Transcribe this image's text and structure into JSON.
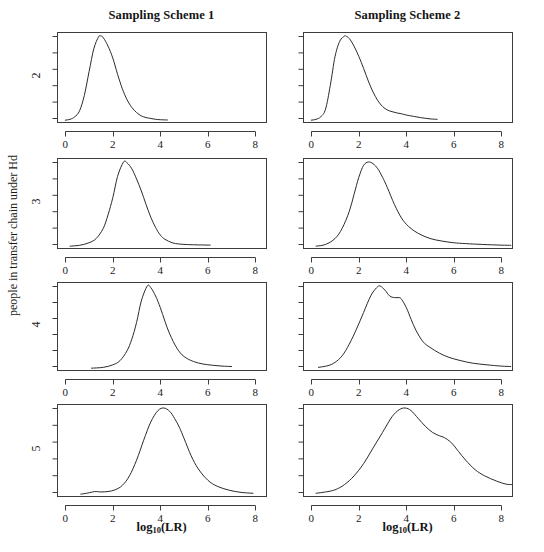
{
  "figure": {
    "width": 544,
    "height": 552,
    "background": "#ffffff",
    "line_color": "#2b2b2b",
    "axis_color": "#3d3d3d",
    "text_color": "#1a1a1a"
  },
  "column_titles": [
    "Sampling Scheme 1",
    "Sampling Scheme 2"
  ],
  "y_axis_label": "people in transfer chain under Hd",
  "x_axis_label_parts": {
    "main": "log",
    "sub": "10",
    "tail": "(LR)"
  },
  "x_axis_label": "log10(LR)",
  "row_labels": [
    "2",
    "3",
    "4",
    "5"
  ],
  "x_tick_labels": [
    "0",
    "2",
    "4",
    "6",
    "8"
  ],
  "chart_data": {
    "type": "line",
    "subtitle": "",
    "xlabel": "log10(LR)",
    "ylabel": "people in transfer chain under Hd",
    "grid": false,
    "legend": "none",
    "xlim": [
      -0.35,
      8.45
    ],
    "x_ticks": [
      0,
      2,
      4,
      6,
      8
    ],
    "y_ticks_labeled": false,
    "y_tick_count": 6,
    "columns": [
      "Sampling Scheme 1",
      "Sampling Scheme 2"
    ],
    "rows": [
      "2",
      "3",
      "4",
      "5"
    ],
    "panels": [
      {
        "row": "2",
        "column": "Sampling Scheme 1",
        "description": "Right-skewed density peaking near log10(LR) = 1.5",
        "mode": 1.5,
        "support": [
          0.0,
          4.3
        ],
        "x": [
          0.0,
          0.2,
          0.4,
          0.6,
          0.8,
          1.0,
          1.2,
          1.4,
          1.5,
          1.6,
          1.8,
          2.0,
          2.2,
          2.4,
          2.6,
          2.8,
          3.0,
          3.2,
          3.4,
          3.6,
          3.8,
          4.0,
          4.3
        ],
        "y": [
          0.01,
          0.02,
          0.05,
          0.12,
          0.3,
          0.58,
          0.85,
          0.99,
          1.0,
          0.98,
          0.88,
          0.74,
          0.55,
          0.38,
          0.25,
          0.16,
          0.1,
          0.06,
          0.04,
          0.03,
          0.02,
          0.015,
          0.012
        ]
      },
      {
        "row": "2",
        "column": "Sampling Scheme 2",
        "description": "Right-skewed density peaking near log10(LR) = 1.45 with long shoulder to 5.2",
        "mode": 1.45,
        "support": [
          0.0,
          5.3
        ],
        "x": [
          0.0,
          0.2,
          0.4,
          0.6,
          0.8,
          1.0,
          1.2,
          1.4,
          1.45,
          1.6,
          1.8,
          2.0,
          2.2,
          2.4,
          2.6,
          2.8,
          3.0,
          3.2,
          3.4,
          3.6,
          3.8,
          4.0,
          4.3,
          4.6,
          5.0,
          5.3
        ],
        "y": [
          0.01,
          0.02,
          0.05,
          0.14,
          0.42,
          0.76,
          0.94,
          1.0,
          1.0,
          0.97,
          0.88,
          0.76,
          0.62,
          0.47,
          0.34,
          0.24,
          0.17,
          0.13,
          0.11,
          0.095,
          0.085,
          0.07,
          0.055,
          0.04,
          0.025,
          0.02
        ]
      },
      {
        "row": "3",
        "column": "Sampling Scheme 1",
        "description": "Density peaking near log10(LR) = 2.45, tail to 6.1",
        "mode": 2.45,
        "support": [
          0.2,
          6.1
        ],
        "x": [
          0.2,
          0.6,
          1.0,
          1.3,
          1.6,
          1.8,
          2.0,
          2.2,
          2.45,
          2.6,
          2.8,
          3.0,
          3.2,
          3.4,
          3.6,
          3.8,
          4.0,
          4.2,
          4.5,
          4.8,
          5.2,
          5.6,
          6.1
        ],
        "y": [
          0.01,
          0.02,
          0.05,
          0.1,
          0.22,
          0.38,
          0.58,
          0.83,
          1.0,
          0.99,
          0.92,
          0.8,
          0.66,
          0.5,
          0.35,
          0.23,
          0.14,
          0.09,
          0.05,
          0.035,
          0.028,
          0.025,
          0.022
        ]
      },
      {
        "row": "3",
        "column": "Sampling Scheme 2",
        "description": "Density peaking near log10(LR) = 2.4 with heavier right tail to 8.4",
        "mode": 2.4,
        "support": [
          0.2,
          8.4
        ],
        "x": [
          0.2,
          0.6,
          1.0,
          1.3,
          1.6,
          1.8,
          2.0,
          2.2,
          2.4,
          2.6,
          2.8,
          3.0,
          3.2,
          3.5,
          3.8,
          4.1,
          4.5,
          5.0,
          5.5,
          6.0,
          6.5,
          7.2,
          8.0,
          8.4
        ],
        "y": [
          0.01,
          0.03,
          0.1,
          0.22,
          0.42,
          0.62,
          0.82,
          0.96,
          1.0,
          0.98,
          0.92,
          0.82,
          0.7,
          0.5,
          0.34,
          0.24,
          0.16,
          0.1,
          0.07,
          0.05,
          0.04,
          0.03,
          0.022,
          0.02
        ]
      },
      {
        "row": "4",
        "column": "Sampling Scheme 1",
        "description": "Density peaking near log10(LR) = 3.45, support from 1.1 to 7.0",
        "mode": 3.45,
        "support": [
          1.1,
          7.0
        ],
        "x": [
          1.1,
          1.6,
          2.0,
          2.3,
          2.6,
          2.8,
          3.0,
          3.2,
          3.45,
          3.6,
          3.8,
          4.0,
          4.2,
          4.4,
          4.7,
          5.0,
          5.4,
          5.8,
          6.2,
          6.6,
          7.0
        ],
        "y": [
          0.01,
          0.02,
          0.05,
          0.1,
          0.22,
          0.36,
          0.56,
          0.82,
          1.0,
          0.98,
          0.88,
          0.74,
          0.57,
          0.42,
          0.25,
          0.15,
          0.09,
          0.06,
          0.045,
          0.035,
          0.03
        ]
      },
      {
        "row": "4",
        "column": "Sampling Scheme 2",
        "description": "Bimodal density, primary mode near 2.9 with a shoulder near 3.75, long tail to 8.4",
        "mode": 2.9,
        "secondary_mode": 3.75,
        "support": [
          0.3,
          8.4
        ],
        "x": [
          0.3,
          0.7,
          1.0,
          1.3,
          1.6,
          1.9,
          2.2,
          2.5,
          2.75,
          2.9,
          3.1,
          3.3,
          3.5,
          3.7,
          3.8,
          4.0,
          4.2,
          4.4,
          4.7,
          5.0,
          5.4,
          5.8,
          6.3,
          6.8,
          7.4,
          8.0,
          8.4
        ],
        "y": [
          0.02,
          0.04,
          0.08,
          0.16,
          0.3,
          0.48,
          0.68,
          0.88,
          0.98,
          1.0,
          0.95,
          0.88,
          0.86,
          0.86,
          0.84,
          0.74,
          0.6,
          0.47,
          0.33,
          0.26,
          0.19,
          0.14,
          0.1,
          0.07,
          0.05,
          0.035,
          0.03
        ]
      },
      {
        "row": "5",
        "column": "Sampling Scheme 1",
        "description": "Density peaking near log10(LR) = 4.15 with small bump near 1.3 and tail to 7.9",
        "mode": 4.15,
        "support": [
          0.65,
          7.9
        ],
        "x": [
          0.65,
          0.9,
          1.15,
          1.3,
          1.5,
          1.8,
          2.1,
          2.4,
          2.7,
          3.0,
          3.3,
          3.6,
          3.9,
          4.15,
          4.4,
          4.6,
          4.8,
          5.0,
          5.3,
          5.6,
          6.0,
          6.4,
          6.9,
          7.4,
          7.9
        ],
        "y": [
          0.01,
          0.02,
          0.035,
          0.04,
          0.035,
          0.04,
          0.06,
          0.11,
          0.22,
          0.4,
          0.63,
          0.84,
          0.97,
          1.0,
          0.96,
          0.88,
          0.78,
          0.65,
          0.45,
          0.3,
          0.17,
          0.1,
          0.055,
          0.03,
          0.02
        ]
      },
      {
        "row": "5",
        "column": "Sampling Scheme 2",
        "description": "Broad density peaking near log10(LR) = 3.95 with a pronounced shoulder near 5.6 and tail beyond 8.4",
        "mode": 3.95,
        "secondary_mode": 5.6,
        "support": [
          0.2,
          8.45
        ],
        "x": [
          0.2,
          0.6,
          1.0,
          1.4,
          1.8,
          2.2,
          2.6,
          3.0,
          3.4,
          3.7,
          3.95,
          4.2,
          4.5,
          4.8,
          5.1,
          5.4,
          5.6,
          5.9,
          6.2,
          6.5,
          6.9,
          7.3,
          7.8,
          8.2,
          8.45
        ],
        "y": [
          0.02,
          0.035,
          0.06,
          0.12,
          0.22,
          0.36,
          0.54,
          0.72,
          0.9,
          0.98,
          1.0,
          0.97,
          0.88,
          0.79,
          0.72,
          0.68,
          0.66,
          0.6,
          0.5,
          0.4,
          0.29,
          0.22,
          0.16,
          0.125,
          0.12
        ]
      }
    ]
  },
  "layout": {
    "panel_left_x": 57,
    "panel_right_x": 266,
    "panel2_left_x": 303,
    "panel2_right_x": 512,
    "row_tops": [
      32,
      158,
      282,
      404
    ],
    "row_bottoms": [
      122,
      248,
      370,
      496
    ],
    "title_y": 8,
    "xlabel_y": 520
  }
}
